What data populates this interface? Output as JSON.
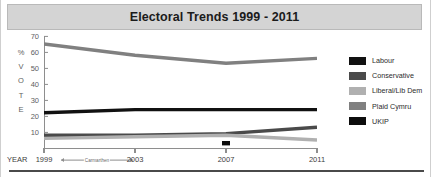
{
  "title": "Electoral Trends 1999 - 2011",
  "axis": {
    "y_label_letters": [
      "%",
      "V",
      "O",
      "T",
      "E"
    ],
    "y_ticks": [
      70,
      60,
      50,
      40,
      30,
      20,
      10
    ],
    "x_axis_name": "YEAR",
    "x_ticks": [
      "1999",
      "2003",
      "2007",
      "2011"
    ],
    "annotation": "Carmarthen"
  },
  "legend": {
    "items": [
      {
        "label": "Labour",
        "color": "#111111"
      },
      {
        "label": "Conservative",
        "color": "#4a4a4a"
      },
      {
        "label": "Liberal/Lib Dem",
        "color": "#b0b0b0"
      },
      {
        "label": "Plaid Cymru",
        "color": "#808080"
      },
      {
        "label": "UKIP",
        "color": "#0d0d0d"
      }
    ]
  },
  "chart_data": {
    "type": "line",
    "title": "Electoral Trends 1999 - 2011",
    "xlabel": "YEAR",
    "ylabel": "% VOTE",
    "x": [
      1999,
      2003,
      2007,
      2011
    ],
    "xlim": [
      1999,
      2011
    ],
    "ylim": [
      0,
      70
    ],
    "yticks": [
      10,
      20,
      30,
      40,
      50,
      60,
      70
    ],
    "grid": false,
    "legend_position": "right",
    "annotations": [
      {
        "text": "Carmarthen",
        "from_x": 1999,
        "to_x": 2003,
        "at_axis": "x"
      }
    ],
    "series": [
      {
        "name": "Labour",
        "color": "#111111",
        "values": [
          22,
          24,
          24,
          24
        ]
      },
      {
        "name": "Conservative",
        "color": "#4a4a4a",
        "values": [
          8,
          8,
          9,
          13
        ]
      },
      {
        "name": "Liberal/Lib Dem",
        "color": "#b0b0b0",
        "values": [
          6,
          7,
          8,
          5
        ]
      },
      {
        "name": "Plaid Cymru",
        "color": "#808080",
        "values": [
          65,
          58,
          53,
          56
        ]
      },
      {
        "name": "UKIP",
        "color": "#0d0d0d",
        "values": [
          null,
          null,
          3,
          null
        ],
        "marker_only": true
      }
    ]
  }
}
